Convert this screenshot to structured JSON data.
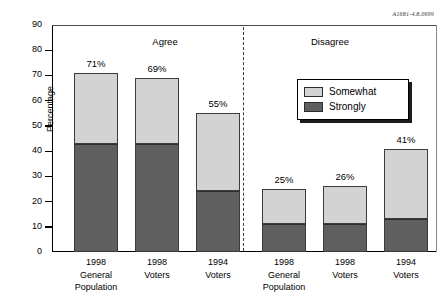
{
  "corner_code": "A1681-4.8.0699",
  "legend": {
    "position": "inside-top-right",
    "items": [
      {
        "label": "Somewhat",
        "color": "#d3d3d3",
        "swatch_name": "legend-swatch-somewhat"
      },
      {
        "label": "Strongly",
        "color": "#5f5f5f",
        "swatch_name": "legend-swatch-strongly"
      }
    ]
  },
  "group_headers": [
    {
      "label": "Agree",
      "left": 95,
      "width": 140
    },
    {
      "label": "Disagree",
      "left": 255,
      "width": 150
    }
  ],
  "y_axis": {
    "label": "Percentage",
    "ticks": [
      0,
      10,
      20,
      30,
      40,
      50,
      60,
      70,
      80,
      90
    ],
    "min": 0,
    "max": 90
  },
  "chart_data": {
    "type": "bar",
    "subtype": "stacked-bar",
    "title": "",
    "xlabel": "",
    "ylabel": "Percentage",
    "ylim": [
      0,
      90
    ],
    "grid": false,
    "legend_position": "inside-top-right",
    "groups": [
      "Agree",
      "Disagree"
    ],
    "categories": [
      "1998 General Population",
      "1998 Voters",
      "1994 Voters",
      "1998 General Population",
      "1998 Voters",
      "1994 Voters"
    ],
    "category_lines": [
      [
        "1998",
        "General",
        "Population"
      ],
      [
        "1998",
        "Voters",
        ""
      ],
      [
        "1994",
        "Voters",
        ""
      ],
      [
        "1998",
        "General",
        "Population"
      ],
      [
        "1998",
        "Voters",
        ""
      ],
      [
        "1994",
        "Voters",
        ""
      ]
    ],
    "series": [
      {
        "name": "Strongly",
        "color": "#5f5f5f",
        "values": [
          43,
          43,
          24,
          11,
          11,
          13
        ]
      },
      {
        "name": "Somewhat",
        "color": "#d3d3d3",
        "values": [
          28,
          26,
          31,
          14,
          15,
          28
        ]
      }
    ],
    "totals": [
      71,
      69,
      55,
      25,
      26,
      41
    ],
    "data_labels": [
      "71%",
      "69%",
      "55%",
      "25%",
      "26%",
      "41%"
    ],
    "group_of_bar": [
      "Agree",
      "Agree",
      "Agree",
      "Disagree",
      "Disagree",
      "Disagree"
    ]
  },
  "bars": [
    {
      "name": "bar-agree-1998-general-population",
      "total_label": "71%",
      "strongly": 43,
      "somewhat": 28,
      "total": 71,
      "left": 74
    },
    {
      "name": "bar-agree-1998-voters",
      "total_label": "69%",
      "strongly": 43,
      "somewhat": 26,
      "total": 69,
      "left": 135
    },
    {
      "name": "bar-agree-1994-voters",
      "total_label": "55%",
      "strongly": 24,
      "somewhat": 31,
      "total": 55,
      "left": 196
    },
    {
      "name": "bar-disagree-1998-general-population",
      "total_label": "25%",
      "strongly": 11,
      "somewhat": 14,
      "total": 25,
      "left": 262
    },
    {
      "name": "bar-disagree-1998-voters",
      "total_label": "26%",
      "strongly": 11,
      "somewhat": 15,
      "total": 26,
      "left": 323
    },
    {
      "name": "bar-disagree-1994-voters",
      "total_label": "41%",
      "strongly": 13,
      "somewhat": 28,
      "total": 41,
      "left": 384
    }
  ]
}
